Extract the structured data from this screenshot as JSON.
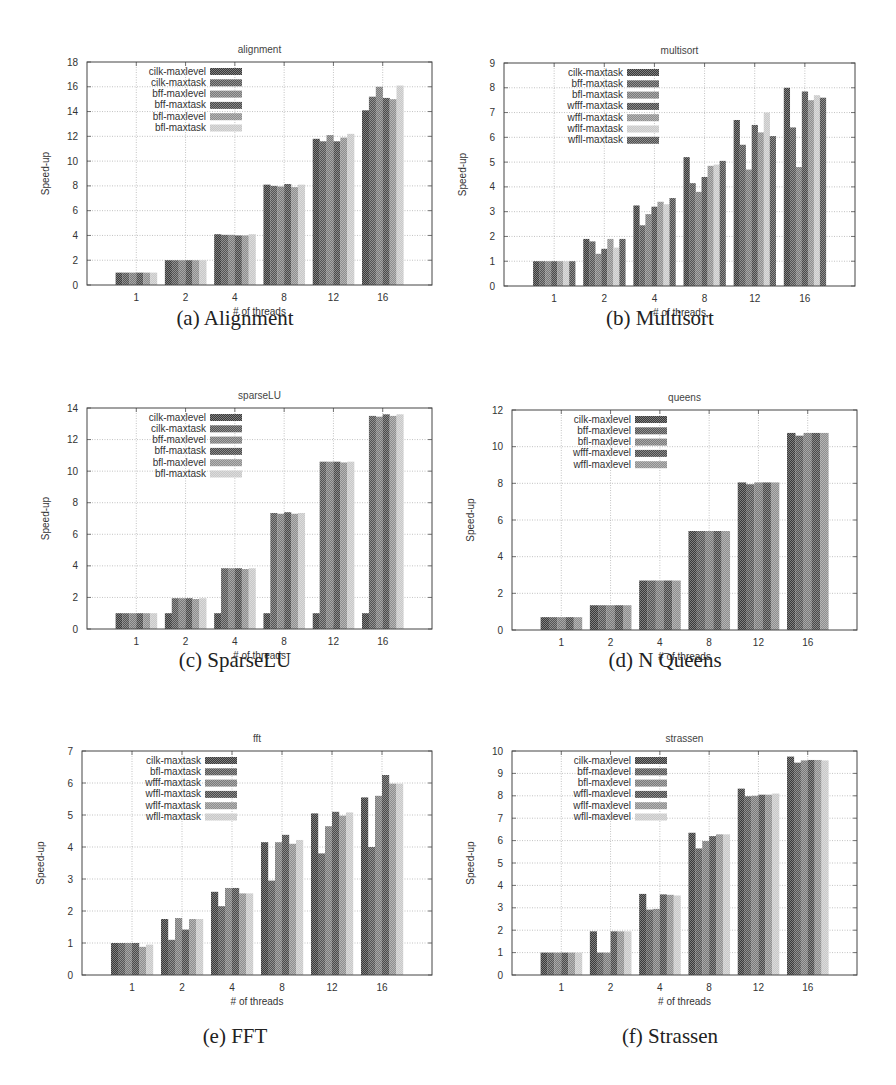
{
  "figure": {
    "captions": [
      "(a) Alignment",
      "(b) Multisort",
      "(c) SparseLU",
      "(d) N Queens",
      "(e) FFT",
      "(f) Strassen"
    ]
  },
  "patterns": {
    "series_shades": [
      "#3a3a3a",
      "#555555",
      "#7a7a7a",
      "#4a4a4a",
      "#8e8e8e",
      "#c8c8c8",
      "#4f4f4f"
    ]
  },
  "chart_data": [
    {
      "id": "alignment",
      "type": "bar",
      "title": "alignment",
      "xlabel": "# of threads",
      "ylabel": "Speed-up",
      "ylim": [
        0,
        18
      ],
      "yticks": [
        0,
        2,
        4,
        6,
        8,
        10,
        12,
        14,
        16,
        18
      ],
      "grid": true,
      "legend_position": "upper-left",
      "categories": [
        "1",
        "2",
        "4",
        "8",
        "12",
        "16"
      ],
      "series": [
        {
          "name": "cilk-maxlevel",
          "values": [
            1.0,
            2.0,
            4.1,
            8.1,
            11.8,
            14.1
          ]
        },
        {
          "name": "cilk-maxtask",
          "values": [
            1.0,
            2.0,
            4.05,
            8.0,
            11.6,
            15.2
          ]
        },
        {
          "name": "bff-maxlevel",
          "values": [
            1.0,
            2.0,
            4.05,
            7.95,
            12.1,
            16.0
          ]
        },
        {
          "name": "bff-maxtask",
          "values": [
            1.0,
            2.0,
            4.0,
            8.15,
            11.6,
            15.1
          ]
        },
        {
          "name": "bfl-maxlevel",
          "values": [
            1.0,
            2.0,
            4.0,
            7.9,
            11.9,
            15.0
          ]
        },
        {
          "name": "bfl-maxtask",
          "values": [
            1.0,
            2.0,
            4.1,
            8.1,
            12.2,
            16.1
          ]
        }
      ]
    },
    {
      "id": "multisort",
      "type": "bar",
      "title": "multisort",
      "xlabel": "# of threads",
      "ylabel": "Speed-up",
      "ylim": [
        0,
        9
      ],
      "yticks": [
        0,
        1,
        2,
        3,
        4,
        5,
        6,
        7,
        8,
        9
      ],
      "grid": true,
      "legend_position": "upper-left",
      "categories": [
        "1",
        "2",
        "4",
        "8",
        "12",
        "16"
      ],
      "series": [
        {
          "name": "cilk-maxtask",
          "values": [
            1.0,
            1.9,
            3.25,
            5.2,
            6.7,
            8.0
          ]
        },
        {
          "name": "bff-maxtask",
          "values": [
            1.0,
            1.8,
            2.45,
            4.15,
            5.7,
            6.4
          ]
        },
        {
          "name": "bfl-maxtask",
          "values": [
            1.0,
            1.3,
            2.9,
            3.8,
            4.7,
            4.8
          ]
        },
        {
          "name": "wfff-maxtask",
          "values": [
            1.0,
            1.5,
            3.2,
            4.4,
            6.5,
            7.85
          ]
        },
        {
          "name": "wffl-maxtask",
          "values": [
            1.0,
            1.9,
            3.4,
            4.85,
            6.2,
            7.5
          ]
        },
        {
          "name": "wflf-maxtask",
          "values": [
            1.0,
            1.55,
            3.3,
            4.9,
            7.0,
            7.7
          ]
        },
        {
          "name": "wfll-maxtask",
          "values": [
            1.0,
            1.9,
            3.55,
            5.05,
            6.05,
            7.6
          ]
        }
      ]
    },
    {
      "id": "sparseLU",
      "type": "bar",
      "title": "sparseLU",
      "xlabel": "# of threads",
      "ylabel": "Speed-up",
      "ylim": [
        0,
        14
      ],
      "yticks": [
        0,
        2,
        4,
        6,
        8,
        10,
        12,
        14
      ],
      "grid": true,
      "legend_position": "upper-left",
      "categories": [
        "1",
        "2",
        "4",
        "8",
        "12",
        "16"
      ],
      "series": [
        {
          "name": "cilk-maxlevel",
          "values": [
            1.0,
            1.0,
            1.0,
            1.0,
            1.0,
            1.0
          ]
        },
        {
          "name": "cilk-maxtask",
          "values": [
            1.0,
            1.95,
            3.85,
            7.35,
            10.6,
            13.5
          ]
        },
        {
          "name": "bff-maxlevel",
          "values": [
            1.0,
            1.95,
            3.85,
            7.3,
            10.6,
            13.45
          ]
        },
        {
          "name": "bff-maxtask",
          "values": [
            1.0,
            1.95,
            3.85,
            7.4,
            10.6,
            13.6
          ]
        },
        {
          "name": "bfl-maxlevel",
          "values": [
            1.0,
            1.9,
            3.8,
            7.3,
            10.55,
            13.5
          ]
        },
        {
          "name": "bfl-maxtask",
          "values": [
            1.0,
            1.95,
            3.85,
            7.35,
            10.6,
            13.6
          ]
        }
      ]
    },
    {
      "id": "queens",
      "type": "bar",
      "title": "queens",
      "xlabel": "# of threads",
      "ylabel": "Speed-up",
      "ylim": [
        0,
        12
      ],
      "yticks": [
        0,
        2,
        4,
        6,
        8,
        10,
        12
      ],
      "grid": true,
      "legend_position": "upper-left",
      "categories": [
        "1",
        "2",
        "4",
        "8",
        "12",
        "16"
      ],
      "series": [
        {
          "name": "cilk-maxlevel",
          "values": [
            0.7,
            1.35,
            2.7,
            5.4,
            8.05,
            10.75
          ]
        },
        {
          "name": "bff-maxlevel",
          "values": [
            0.7,
            1.35,
            2.7,
            5.4,
            7.95,
            10.6
          ]
        },
        {
          "name": "bfl-maxlevel",
          "values": [
            0.7,
            1.35,
            2.7,
            5.4,
            8.05,
            10.75
          ]
        },
        {
          "name": "wfff-maxlevel",
          "values": [
            0.7,
            1.35,
            2.7,
            5.4,
            8.05,
            10.75
          ]
        },
        {
          "name": "wffl-maxlevel",
          "values": [
            0.7,
            1.35,
            2.7,
            5.4,
            8.05,
            10.75
          ]
        }
      ]
    },
    {
      "id": "fft",
      "type": "bar",
      "title": "fft",
      "xlabel": "# of threads",
      "ylabel": "Speed-up",
      "ylim": [
        0,
        7
      ],
      "yticks": [
        0,
        1,
        2,
        3,
        4,
        5,
        6,
        7
      ],
      "grid": true,
      "legend_position": "upper-left",
      "categories": [
        "1",
        "2",
        "4",
        "8",
        "12",
        "16"
      ],
      "series": [
        {
          "name": "cilk-maxtask",
          "values": [
            1.0,
            1.75,
            2.6,
            4.15,
            5.05,
            5.55
          ]
        },
        {
          "name": "bfl-maxtask",
          "values": [
            1.0,
            1.1,
            2.15,
            2.95,
            3.8,
            4.0
          ]
        },
        {
          "name": "wfff-maxtask",
          "values": [
            1.0,
            1.78,
            2.72,
            4.15,
            4.65,
            5.6
          ]
        },
        {
          "name": "wffl-maxtask",
          "values": [
            1.0,
            1.42,
            2.72,
            4.38,
            5.1,
            6.25
          ]
        },
        {
          "name": "wflf-maxtask",
          "values": [
            0.88,
            1.75,
            2.55,
            4.1,
            4.98,
            5.98
          ]
        },
        {
          "name": "wfll-maxtask",
          "values": [
            0.95,
            1.75,
            2.55,
            4.22,
            5.08,
            5.98
          ]
        }
      ]
    },
    {
      "id": "strassen",
      "type": "bar",
      "title": "strassen",
      "xlabel": "# of threads",
      "ylabel": "Speed-up",
      "ylim": [
        0,
        10
      ],
      "yticks": [
        0,
        1,
        2,
        3,
        4,
        5,
        6,
        7,
        8,
        9,
        10
      ],
      "grid": true,
      "legend_position": "upper-left",
      "categories": [
        "1",
        "2",
        "4",
        "8",
        "12",
        "16"
      ],
      "series": [
        {
          "name": "cilk-maxlevel",
          "values": [
            1.0,
            1.95,
            3.62,
            6.35,
            8.32,
            9.75
          ]
        },
        {
          "name": "bff-maxlevel",
          "values": [
            1.0,
            1.0,
            2.92,
            5.65,
            7.98,
            9.48
          ]
        },
        {
          "name": "bfl-maxlevel",
          "values": [
            1.0,
            1.0,
            2.95,
            5.98,
            8.0,
            9.58
          ]
        },
        {
          "name": "wffl-maxlevel",
          "values": [
            1.0,
            1.95,
            3.6,
            6.2,
            8.05,
            9.6
          ]
        },
        {
          "name": "wflf-maxlevel",
          "values": [
            1.0,
            1.95,
            3.58,
            6.28,
            8.05,
            9.6
          ]
        },
        {
          "name": "wfll-maxlevel",
          "values": [
            1.0,
            1.95,
            3.55,
            6.28,
            8.1,
            9.58
          ]
        }
      ]
    }
  ]
}
